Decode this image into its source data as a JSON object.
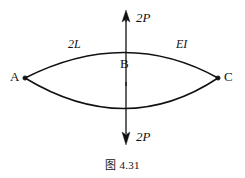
{
  "figure": {
    "caption": "图 4.31",
    "background_color": "#ffffff",
    "stroke_color": "#111111",
    "diagram_type": "structural-mechanics-free-body-diagram"
  },
  "nodes": {
    "a": {
      "label": "A",
      "x": 25,
      "y": 78,
      "support": "pin"
    },
    "b": {
      "label": "B",
      "x": 126,
      "y": 78,
      "support": "none"
    },
    "c": {
      "label": "C",
      "x": 218,
      "y": 78,
      "support": "pin"
    }
  },
  "members": {
    "left_span_label": "2L",
    "right_section_label": "EI"
  },
  "loads": {
    "top": {
      "label": "2P",
      "direction": "up",
      "magnitude": "2P"
    },
    "bottom": {
      "label": "2P",
      "direction": "down",
      "magnitude": "2P"
    }
  },
  "geometry": {
    "arc_top_apex_y": 51,
    "arc_bottom_apex_y": 113,
    "axis_x": 126,
    "arrow_top_tip_y": 12,
    "arrow_bottom_tip_y": 143
  }
}
